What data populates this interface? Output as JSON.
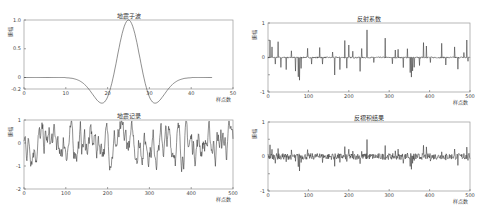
{
  "chart_data": [
    {
      "id": "wavelet",
      "type": "line",
      "title": "地震子波",
      "xlabel": "样点数",
      "ylabel": "振幅",
      "xlim": [
        0,
        50
      ],
      "ylim": [
        -0.2,
        1.0
      ],
      "xticks": [
        0,
        10,
        20,
        30,
        40,
        50
      ],
      "xtick_labels": [
        "0",
        "10",
        "20",
        "30",
        "40",
        "50"
      ],
      "yticks": [
        -0.2,
        0,
        0.5,
        1.0
      ],
      "ytick_labels": [
        "-0.2",
        "0",
        "0.5",
        "1.0"
      ],
      "grid": false,
      "series": [
        {
          "name": "wavelet",
          "description": "Ricker wavelet centered at sample ~25, peak 1.0, side lobes ~-0.2, flat 0 tails from 0-10 and 40-50"
        }
      ],
      "box": [
        24,
        20,
        233,
        89
      ]
    },
    {
      "id": "reflectivity",
      "type": "line",
      "title": "反射系数",
      "xlabel": "样点数",
      "ylabel": "振幅",
      "xlim": [
        0,
        500
      ],
      "ylim": [
        -1,
        1
      ],
      "xticks": [
        0,
        100,
        200,
        300,
        400,
        500
      ],
      "xtick_labels": [
        "0",
        "100",
        "200",
        "300",
        "400",
        "500"
      ],
      "yticks": [
        -1,
        -0.5,
        0,
        0.5,
        1
      ],
      "ytick_labels": [
        "-1",
        "",
        "0",
        "",
        "1"
      ],
      "grid": false,
      "series": [
        {
          "name": "reflectivity",
          "description": "sparse spike series, spikes up to ~0.8 and down to ~-0.65"
        }
      ],
      "box": [
        268,
        23,
        470,
        92
      ]
    },
    {
      "id": "record",
      "type": "line",
      "title": "地震记录",
      "xlabel": "样点数",
      "ylabel": "振幅",
      "xlim": [
        0,
        500
      ],
      "ylim": [
        -2,
        1
      ],
      "xticks": [
        0,
        100,
        200,
        300,
        400,
        500
      ],
      "xtick_labels": [
        "0",
        "100",
        "200",
        "300",
        "400",
        "500"
      ],
      "yticks": [
        -2,
        -1,
        0,
        1
      ],
      "ytick_labels": [
        "-2",
        "-1",
        "0",
        "1"
      ],
      "grid": false,
      "series": [
        {
          "name": "seismic record",
          "description": "dense oscillating trace roughly between -1 and 1, min ~-1.5 near sample 85"
        }
      ],
      "box": [
        24,
        120,
        233,
        189
      ]
    },
    {
      "id": "decon",
      "type": "line",
      "title": "反褶积结果",
      "xlabel": "样点数",
      "ylabel": "振幅",
      "xlim": [
        0,
        500
      ],
      "ylim": [
        -1,
        1
      ],
      "xticks": [
        0,
        100,
        200,
        300,
        400,
        500
      ],
      "xtick_labels": [
        "0",
        "100",
        "200",
        "300",
        "400",
        "500"
      ],
      "yticks": [
        -1,
        -0.5,
        0,
        0.5,
        1
      ],
      "ytick_labels": [
        "-1",
        "",
        "0",
        "",
        "1"
      ],
      "grid": false,
      "series": [
        {
          "name": "deconvolution result",
          "description": "noisy trace near 0 with spikes up to ~0.4 and down to ~-0.6"
        }
      ],
      "box": [
        268,
        122,
        470,
        191
      ]
    }
  ],
  "spikes": {
    "reflectivity": [
      [
        5,
        0.5
      ],
      [
        10,
        0.3
      ],
      [
        18,
        -0.2
      ],
      [
        25,
        0.45
      ],
      [
        32,
        -0.3
      ],
      [
        45,
        -0.35
      ],
      [
        58,
        0.2
      ],
      [
        68,
        -0.4
      ],
      [
        75,
        -0.55
      ],
      [
        78,
        -0.65
      ],
      [
        82,
        -0.3
      ],
      [
        98,
        0.25
      ],
      [
        108,
        -0.2
      ],
      [
        128,
        0.3
      ],
      [
        135,
        -0.2
      ],
      [
        160,
        0.15
      ],
      [
        165,
        -0.5
      ],
      [
        178,
        -0.35
      ],
      [
        190,
        0.5
      ],
      [
        195,
        -0.3
      ],
      [
        200,
        0.35
      ],
      [
        210,
        0.2
      ],
      [
        228,
        -0.4
      ],
      [
        232,
        0.25
      ],
      [
        245,
        0.8
      ],
      [
        262,
        -0.15
      ],
      [
        290,
        0.55
      ],
      [
        308,
        -0.2
      ],
      [
        315,
        0.2
      ],
      [
        322,
        0.25
      ],
      [
        335,
        -0.3
      ],
      [
        345,
        0.25
      ],
      [
        352,
        -0.45
      ],
      [
        355,
        -0.55
      ],
      [
        358,
        -0.4
      ],
      [
        362,
        -0.3
      ],
      [
        375,
        -0.25
      ],
      [
        385,
        0.45
      ],
      [
        392,
        0.35
      ],
      [
        402,
        -0.15
      ],
      [
        430,
        0.4
      ],
      [
        440,
        -0.2
      ],
      [
        462,
        0.3
      ],
      [
        470,
        -0.35
      ],
      [
        485,
        0.15
      ],
      [
        492,
        0.5
      ],
      [
        495,
        -0.1
      ]
    ]
  }
}
